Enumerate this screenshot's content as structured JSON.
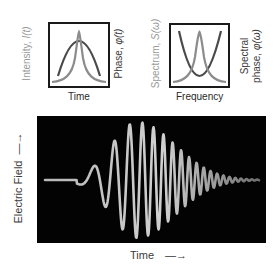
{
  "time_panel": {
    "left_label": "Intensity, ",
    "left_symbol": "I(t)",
    "right_label": "Phase, ",
    "right_symbol": "φ(t)",
    "caption": "Time",
    "curves": [
      {
        "name": "intensity",
        "shape": "narrow-peak",
        "color": "#8c8c8c"
      },
      {
        "name": "phase",
        "shape": "parabola-down",
        "color": "#4a4a4a"
      }
    ]
  },
  "frequency_panel": {
    "left_label": "Spectrum, ",
    "left_symbol": "S(ω)",
    "right_label_line1": "Spectral",
    "right_label_line2": "phase, ",
    "right_symbol": "φ(ω)",
    "caption": "Frequency",
    "curves": [
      {
        "name": "spectrum",
        "shape": "narrow-peak",
        "color": "#8c8c8c"
      },
      {
        "name": "spectral-phase",
        "shape": "parabola-up",
        "color": "#4a4a4a"
      }
    ]
  },
  "field_panel": {
    "y_label": "Electric Field",
    "y_arrow": "→",
    "x_label": "Time",
    "x_arrow": "→",
    "background": "#030303",
    "waveform": "chirped-pulse",
    "stroke_color": "#c8c8c8"
  }
}
